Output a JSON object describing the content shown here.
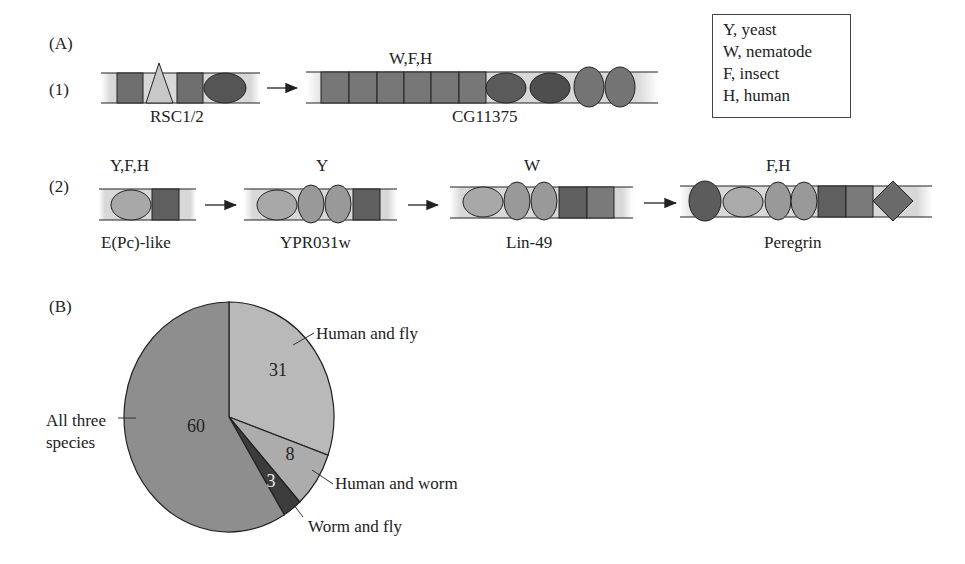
{
  "panel_a": {
    "label": "(A)",
    "row1": {
      "label": "(1)",
      "proteins": [
        {
          "name": "RSC1/2",
          "species": ""
        },
        {
          "name": "CG11375",
          "species": "W,F,H"
        }
      ]
    },
    "row2": {
      "label": "(2)",
      "proteins": [
        {
          "name": "E(Pc)-like",
          "species": "Y,F,H"
        },
        {
          "name": "YPR031w",
          "species": "Y"
        },
        {
          "name": "Lin-49",
          "species": "W"
        },
        {
          "name": "Peregrin",
          "species": "F,H"
        }
      ]
    }
  },
  "legend": {
    "items": [
      "Y, yeast",
      "W, nematode",
      "F, insect",
      "H, human"
    ]
  },
  "panel_b": {
    "label": "(B)"
  },
  "chart_data": {
    "type": "pie",
    "title": "",
    "categories": [
      "Human and fly",
      "Human and worm",
      "Worm and fly",
      "All three species"
    ],
    "values": [
      31,
      8,
      3,
      60
    ],
    "colors": [
      "#b9b9b9",
      "#acacac",
      "#3c3c3c",
      "#8e8e8e"
    ],
    "slice_labels": [
      "31",
      "8",
      "3",
      "60"
    ],
    "start_angle": "12 o'clock, clockwise"
  },
  "colors": {
    "dark_domain": "#5e5e5e",
    "mid_domain": "#7e7e7e",
    "light_domain": "#a9a9a9",
    "triangle": "#c6c6c6",
    "outline": "#222222"
  }
}
